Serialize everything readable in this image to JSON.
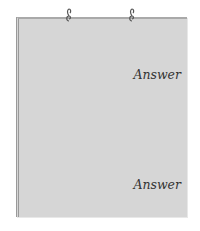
{
  "card": {
    "answers": [
      {
        "label": "Answer"
      },
      {
        "label": "Answer"
      }
    ]
  },
  "colors": {
    "card_bg": "#d6d6d6",
    "border": "#a9a9a9",
    "text": "#333333"
  },
  "icons": [
    "binder-ring-icon",
    "binder-ring-icon"
  ]
}
